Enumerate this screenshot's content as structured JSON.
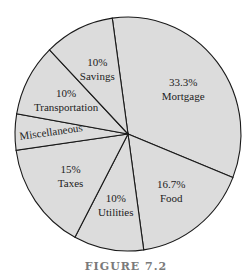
{
  "chart_data": {
    "type": "pie",
    "title": "",
    "slices": [
      {
        "label": "Mortgage",
        "percent_label": "33.3%",
        "value": 33.3
      },
      {
        "label": "Food",
        "percent_label": "16.7%",
        "value": 16.7
      },
      {
        "label": "Utilities",
        "percent_label": "10%",
        "value": 10
      },
      {
        "label": "Taxes",
        "percent_label": "15%",
        "value": 15
      },
      {
        "label": "Miscellaneous",
        "percent_label": "",
        "value": 5
      },
      {
        "label": "Transportation",
        "percent_label": "10%",
        "value": 10
      },
      {
        "label": "Savings",
        "percent_label": "10%",
        "value": 10
      }
    ],
    "colors": {
      "fill": "#dcdcdc",
      "stroke": "#1a1a1a"
    }
  },
  "caption": "FIGURE 7.2"
}
